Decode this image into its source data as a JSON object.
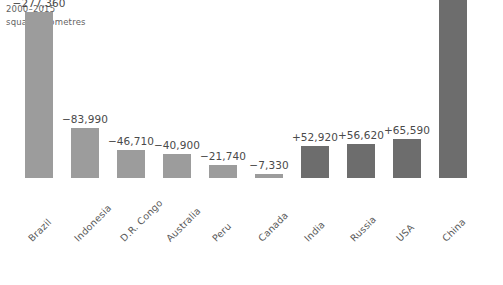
{
  "header": {
    "period": "2000–2015",
    "units": "square kilometres"
  },
  "colors": {
    "negative_bar": "#9c9c9c",
    "positive_bar": "#6d6d6d",
    "value_text": "#4a4a4a",
    "category_text": "#5a5a5a",
    "header_text": "#636363",
    "background": "#ffffff"
  },
  "chart_data": {
    "type": "bar",
    "title": "2000–2015",
    "subtitle": "square kilometres",
    "xlabel": "",
    "ylabel": "square kilometres",
    "grid": false,
    "legend": false,
    "ylim": [
      -277360,
      313208
    ],
    "categories": [
      "Brazil",
      "Indonesia",
      "D.R. Congo",
      "Australia",
      "Peru",
      "Canada",
      "India",
      "Russia",
      "USA",
      "China"
    ],
    "values": [
      -277360,
      -83990,
      -46710,
      -40900,
      -21740,
      -7330,
      52920,
      56620,
      65590,
      313208
    ],
    "data_labels": [
      "−277,360",
      "−83,990",
      "−46,710",
      "−40,900",
      "−21,740",
      "−7,330",
      "+52,920",
      "+56,620",
      "+65,590",
      "+313,208"
    ]
  },
  "bars": [
    {
      "category": "Brazil",
      "label": "−277,360",
      "sign": "neg",
      "x": 25,
      "height": 166
    },
    {
      "category": "Indonesia",
      "label": "−83,990",
      "sign": "neg",
      "x": 71,
      "height": 50
    },
    {
      "category": "D.R. Congo",
      "label": "−46,710",
      "sign": "neg",
      "x": 117,
      "height": 28
    },
    {
      "category": "Australia",
      "label": "−40,900",
      "sign": "neg",
      "x": 163,
      "height": 24
    },
    {
      "category": "Peru",
      "label": "−21,740",
      "sign": "neg",
      "x": 209,
      "height": 13
    },
    {
      "category": "Canada",
      "label": "−7,330",
      "sign": "neg",
      "x": 255,
      "height": 4
    },
    {
      "category": "India",
      "label": "+52,920",
      "sign": "pos",
      "x": 301,
      "height": 32
    },
    {
      "category": "Russia",
      "label": "+56,620",
      "sign": "pos",
      "x": 347,
      "height": 34
    },
    {
      "category": "USA",
      "label": "+65,590",
      "sign": "pos",
      "x": 393,
      "height": 39
    },
    {
      "category": "China",
      "label": "+313,208",
      "sign": "pos",
      "x": 439,
      "height": 188
    }
  ]
}
